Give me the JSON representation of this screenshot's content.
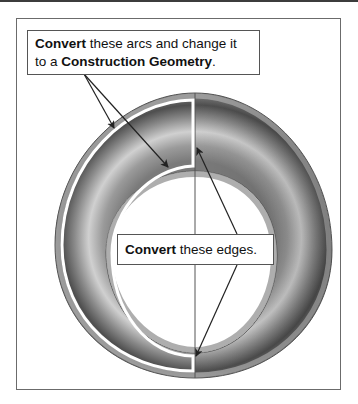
{
  "callouts": {
    "arcs": {
      "bold1": "Convert",
      "text1": " these arcs and change it",
      "text2": "to a ",
      "bold2": "Construction Geometry",
      "text3": "."
    },
    "edges": {
      "bold1": "Convert",
      "text1": " these edges."
    }
  },
  "colors": {
    "ring_dark": "#4a4a4a",
    "ring_mid": "#8c8c8c",
    "ring_light": "#d6d6d6",
    "highlight_outline": "#ffffff",
    "arrow": "#222222",
    "frame": "#6b6b6b"
  }
}
